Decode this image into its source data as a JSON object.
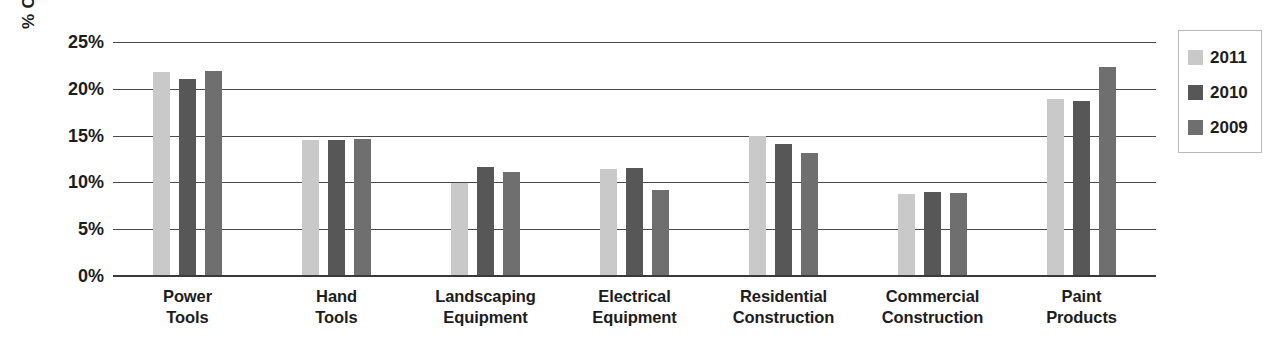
{
  "chart_data": {
    "type": "bar",
    "title": "",
    "subtitle": "",
    "xlabel": "",
    "ylabel": "% OF NET SALES",
    "ylim": [
      0,
      25
    ],
    "ytick_values": [
      25,
      20,
      15,
      10,
      5,
      0
    ],
    "ytick_labels": [
      "25%",
      "20%",
      "15%",
      "10%",
      "5%",
      "0%"
    ],
    "grid": true,
    "legend_position": "right",
    "categories": [
      "Power Tools",
      "Hand Tools",
      "Landscaping Equipment",
      "Electrical Equipment",
      "Residential Construction",
      "Commercial Construction",
      "Paint Products"
    ],
    "category_lines": [
      [
        "Power",
        "Tools"
      ],
      [
        "Hand",
        "Tools"
      ],
      [
        "Landscaping",
        "Equipment"
      ],
      [
        "Electrical",
        "Equipment"
      ],
      [
        "Residential",
        "Construction"
      ],
      [
        "Commercial",
        "Construction"
      ],
      [
        "Paint",
        "Products"
      ]
    ],
    "series": [
      {
        "name": "2011",
        "color": "#c9c9c9",
        "values": [
          21.8,
          14.5,
          9.9,
          11.4,
          15.0,
          8.8,
          18.9
        ]
      },
      {
        "name": "2010",
        "color": "#575757",
        "values": [
          21.1,
          14.5,
          11.7,
          11.5,
          14.1,
          9.0,
          18.7
        ]
      },
      {
        "name": "2009",
        "color": "#6f6f6f",
        "values": [
          21.9,
          14.6,
          11.1,
          9.2,
          13.1,
          8.9,
          22.3
        ]
      }
    ]
  },
  "legend": {
    "items": [
      {
        "label": "2011",
        "color": "#c9c9c9"
      },
      {
        "label": "2010",
        "color": "#575757"
      },
      {
        "label": "2009",
        "color": "#6f6f6f"
      }
    ]
  },
  "colors": {
    "background": "#ffffff",
    "gridline": "#4a4a4a",
    "axis": "#3a3a3a",
    "text": "#1d1d1d",
    "legend_border": "#b9b9b9"
  }
}
